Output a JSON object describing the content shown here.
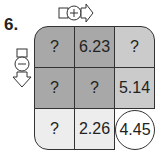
{
  "problem": {
    "number": "6.",
    "add_direction": {
      "icon": "plus-arrow-right-icon",
      "meaning": "add moving right"
    },
    "subtract_direction": {
      "icon": "minus-arrow-down-icon",
      "meaning": "subtract moving down"
    },
    "grid": [
      [
        "?",
        "6.23",
        "?"
      ],
      [
        "?",
        "?",
        "5.14"
      ],
      [
        "?",
        "2.26",
        "4.45"
      ]
    ],
    "colors": {
      "dark": "#a8a8a8",
      "mid": "#cbcbcb",
      "light": "#ededed",
      "answer": "#ffffff"
    }
  }
}
